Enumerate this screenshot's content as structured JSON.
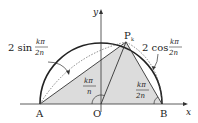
{
  "labels": {
    "A": "A",
    "O": "O",
    "B": "B",
    "P": "P",
    "P_sub": "k",
    "x_axis": "x",
    "y_axis": "y",
    "sin_coef": "2 sin",
    "sin_num": "kπ",
    "sin_den": "2n",
    "cos_coef": "2 cos",
    "cos_num": "kπ",
    "cos_den": "2n",
    "angle_O_num": "kπ",
    "angle_O_den": "n",
    "angle_B_num": "kπ",
    "angle_B_den": "2n"
  },
  "colors": {
    "fill": "#dcdcdc",
    "stroke": "#333333"
  }
}
